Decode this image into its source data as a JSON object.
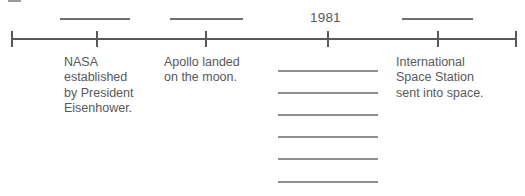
{
  "worksheet": {
    "type": "history-timeline-fill-in",
    "width": 525,
    "height": 196,
    "colors": {
      "axis": "#58595b",
      "text": "#58595b",
      "rule": "#6d6e70",
      "answer_rule": "#8d8e90",
      "background": "#ffffff"
    }
  },
  "timeline": {
    "axis": {
      "start_x": 11,
      "end_x": 517,
      "y": 38
    },
    "ticks": [
      {
        "id": "tick-1",
        "x": 11,
        "has_end_cap": true
      },
      {
        "id": "tick-2",
        "x": 96,
        "has_end_cap": false
      },
      {
        "id": "tick-3",
        "x": 205,
        "has_end_cap": false
      },
      {
        "id": "tick-4",
        "x": 327,
        "has_end_cap": false
      },
      {
        "id": "tick-5",
        "x": 437,
        "has_end_cap": false
      },
      {
        "id": "tick-6",
        "x": 515,
        "has_end_cap": true
      }
    ],
    "date_slots": [
      {
        "id": "date-slot-1",
        "label": "",
        "filled": false,
        "x": 60,
        "y": 18,
        "width": 70,
        "tick": "tick-2"
      },
      {
        "id": "date-slot-2",
        "label": "",
        "filled": false,
        "x": 170,
        "y": 18,
        "width": 73,
        "tick": "tick-3"
      },
      {
        "id": "date-slot-3",
        "label": "1981",
        "filled": true,
        "x": 310,
        "y": 10,
        "tick": "tick-4"
      },
      {
        "id": "date-slot-4",
        "label": "",
        "filled": false,
        "x": 402,
        "y": 18,
        "width": 71,
        "tick": "tick-5"
      }
    ],
    "events": [
      {
        "id": "event-nasa",
        "text": "NASA\nestablished\nby President\nEisenhower.",
        "x": 64,
        "y": 55,
        "width": 92
      },
      {
        "id": "event-apollo",
        "text": "Apollo landed\non the moon.",
        "x": 164,
        "y": 55,
        "width": 105
      },
      {
        "id": "event-iss",
        "text": "International\nSpace Station\nsent into space.",
        "x": 396,
        "y": 55,
        "width": 120
      }
    ]
  },
  "answer_area": {
    "count": 6,
    "left": 278,
    "width": 100,
    "rules": [
      {
        "id": "answer-rule-1",
        "y": 70,
        "value": ""
      },
      {
        "id": "answer-rule-2",
        "y": 92,
        "value": ""
      },
      {
        "id": "answer-rule-3",
        "y": 114,
        "value": ""
      },
      {
        "id": "answer-rule-4",
        "y": 136,
        "value": ""
      },
      {
        "id": "answer-rule-5",
        "y": 158,
        "value": ""
      },
      {
        "id": "answer-rule-6",
        "y": 181,
        "value": ""
      }
    ]
  },
  "stray_marks": [
    {
      "id": "stray-mark-top-left",
      "x": 8,
      "y": 0,
      "width": 13,
      "height": 2
    }
  ]
}
